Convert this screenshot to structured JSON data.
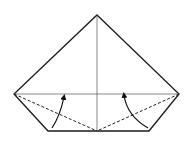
{
  "diagram": {
    "type": "origami-fold-diagram",
    "colors": {
      "background": "#ffffff",
      "outline": "#1a1a1a",
      "crease": "#555555",
      "fold_line": "#222222",
      "arrow": "#111111"
    },
    "shape": {
      "outline_points": [
        [
          97,
          15
        ],
        [
          179,
          94
        ],
        [
          149,
          131
        ],
        [
          48,
          131
        ],
        [
          14,
          94
        ]
      ],
      "center_crease": [
        [
          97,
          15
        ],
        [
          97,
          131
        ]
      ],
      "horizontal_crease": [
        [
          14,
          94
        ],
        [
          179,
          94
        ]
      ],
      "valley_folds": [
        {
          "from": [
            14,
            94
          ],
          "to": [
            97,
            131
          ]
        },
        {
          "from": [
            179,
            94
          ],
          "to": [
            97,
            131
          ]
        }
      ]
    },
    "arrows": [
      {
        "name": "left-fold-arrow",
        "start": [
          52,
          128
        ],
        "control": [
          58,
          112
        ],
        "end": [
          64,
          96
        ]
      },
      {
        "name": "right-fold-arrow",
        "start": [
          148,
          128
        ],
        "control": [
          126,
          116
        ],
        "end": [
          124,
          94
        ]
      }
    ]
  }
}
